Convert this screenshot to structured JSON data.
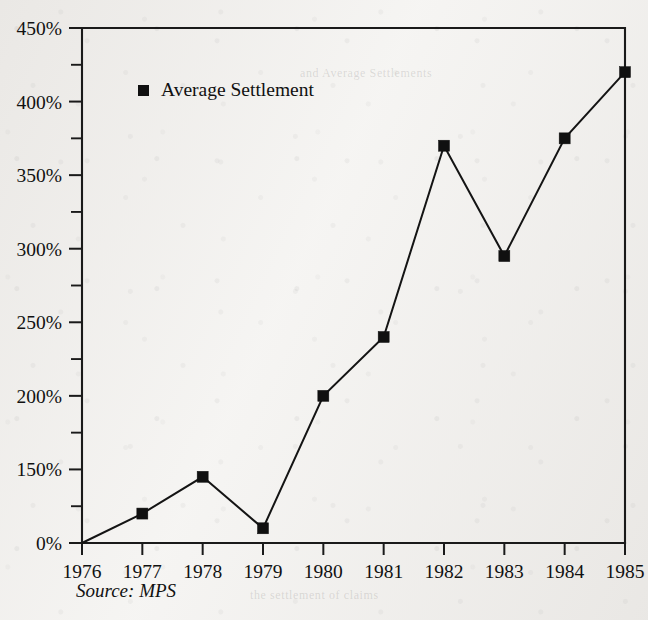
{
  "chart_data": {
    "type": "line",
    "title": "",
    "xlabel": "",
    "ylabel": "",
    "grid": false,
    "legend_position": "inside-top-left",
    "categories": [
      "1976",
      "1977",
      "1978",
      "1979",
      "1980",
      "1981",
      "1982",
      "1983",
      "1984",
      "1985"
    ],
    "series": [
      {
        "name": "Average Settlement",
        "marker": "filled-square",
        "color": "#101010",
        "values": [
          100,
          120,
          145,
          110,
          200,
          240,
          370,
          295,
          375,
          420
        ]
      }
    ],
    "ylim": [
      100,
      450
    ],
    "y_tick_values": [
      100,
      150,
      200,
      250,
      300,
      350,
      400,
      450
    ],
    "y_tick_labels": [
      "0%",
      "150%",
      "200%",
      "250%",
      "300%",
      "350%",
      "400%",
      "450%"
    ],
    "y_minor_tick_values": [
      125,
      175,
      225,
      275,
      325,
      375,
      425
    ],
    "x_tick_labels": [
      "1976",
      "1977",
      "1978",
      "1979",
      "1980",
      "1981",
      "1982",
      "1983",
      "1984",
      "1985"
    ],
    "annotations": [
      "Source: MPS"
    ]
  },
  "legend": {
    "entries": [
      {
        "label": "Average Settlement",
        "marker": "filled-square"
      }
    ]
  },
  "footnote": {
    "source_label": "Source: MPS"
  },
  "ghost_marks": [
    {
      "text": "and Average Settlements",
      "x": 300,
      "y": 74
    },
    {
      "text": "the settlement of claims",
      "x": 250,
      "y": 596
    }
  ],
  "colors": {
    "ink": "#111111",
    "paper": "#f5f4f2",
    "line": "#141414"
  }
}
